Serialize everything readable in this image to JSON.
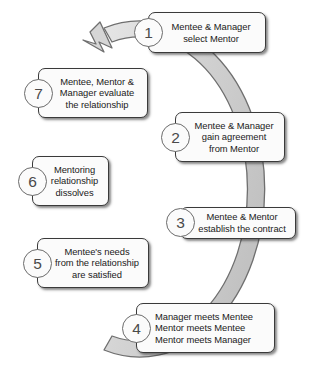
{
  "diagram": {
    "type": "cycle-diagram",
    "direction": "clockwise",
    "ring": {
      "fill_color": "#d2d2d2",
      "stroke_color": "#6f6f6f",
      "arrowhead_position": "top-left",
      "arrowhead_points_to": "step-1"
    },
    "box_style": {
      "fill_color": "#fbfbfb",
      "border_color": "#3a3a3a",
      "number_circle_border_color": "#6b6b6b",
      "text_color": "#1a1a1a"
    },
    "steps": [
      {
        "number": "1",
        "lines": [
          "Mentee & Manager",
          "select Mentor"
        ],
        "align": "center",
        "box": {
          "x": 148,
          "y": 12,
          "w": 118,
          "h": 41
        },
        "circle": {
          "x": 134,
          "y": 18
        }
      },
      {
        "number": "2",
        "lines": [
          "Mentee & Manager",
          "gain agreement",
          "from Mentor"
        ],
        "align": "center",
        "box": {
          "x": 175,
          "y": 112,
          "w": 110,
          "h": 50
        },
        "circle": {
          "x": 161,
          "y": 123
        }
      },
      {
        "number": "3",
        "lines": [
          "Mentee & Mentor",
          "establish the contract"
        ],
        "align": "center",
        "box": {
          "x": 180,
          "y": 207,
          "w": 116,
          "h": 32
        },
        "circle": {
          "x": 166,
          "y": 208
        }
      },
      {
        "number": "4",
        "lines": [
          "Manager meets Mentee",
          "Mentor meets Mentee",
          "Mentor meets Manager"
        ],
        "align": "left",
        "box": {
          "x": 136,
          "y": 303,
          "w": 139,
          "h": 50
        },
        "circle": {
          "x": 122,
          "y": 314
        }
      },
      {
        "number": "5",
        "lines": [
          "Mentee's needs",
          "from the relationship",
          "are satisfied"
        ],
        "align": "center",
        "box": {
          "x": 37,
          "y": 238,
          "w": 112,
          "h": 50
        },
        "circle": {
          "x": 23,
          "y": 249
        }
      },
      {
        "number": "6",
        "lines": [
          "Mentoring",
          "relationship",
          "dissolves"
        ],
        "align": "center",
        "box": {
          "x": 32,
          "y": 156,
          "w": 77,
          "h": 50
        },
        "circle": {
          "x": 18,
          "y": 167
        }
      },
      {
        "number": "7",
        "lines": [
          "Mentee, Mentor &",
          "Manager evaluate",
          "the relationship"
        ],
        "align": "center",
        "box": {
          "x": 38,
          "y": 68,
          "w": 110,
          "h": 50
        },
        "circle": {
          "x": 24,
          "y": 79
        }
      }
    ]
  }
}
